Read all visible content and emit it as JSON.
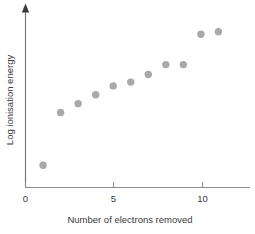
{
  "chart_data": {
    "type": "scatter",
    "title": "",
    "xlabel": "Number of electrons removed",
    "ylabel": "Log ionisation energy",
    "x": [
      1,
      2,
      3,
      4,
      5,
      6,
      7,
      8,
      9,
      10,
      11
    ],
    "values": [
      1.0,
      3.38,
      3.78,
      4.18,
      4.58,
      4.75,
      5.09,
      5.54,
      5.54,
      6.91,
      7.02
    ],
    "series": [
      {
        "name": "Log ionisation energy",
        "x": [
          1,
          2,
          3,
          4,
          5,
          6,
          7,
          8,
          9,
          10,
          11
        ],
        "values": [
          1.0,
          3.38,
          3.78,
          4.18,
          4.58,
          4.75,
          5.09,
          5.54,
          5.54,
          6.91,
          7.02
        ]
      }
    ],
    "xlim": [
      0,
      12.8
    ],
    "ylim": [
      0,
      8.0
    ],
    "xticks": [
      0,
      5,
      10
    ],
    "xtick_labels": [
      "0",
      "5",
      "10"
    ],
    "yticks": [],
    "ytick_labels": [],
    "grid": false,
    "legend": false,
    "legend_position": "none",
    "marker": "circle",
    "marker_color": "#a9a9a9",
    "marker_size": 7.4,
    "axis_color": "#8c8c8c",
    "text_color": "#3a3a3a",
    "background_color": "#ffffff",
    "y_axis_arrow": true,
    "x_axis_arrow": false,
    "annotations": []
  },
  "axes": {
    "x_title": "Number of electrons removed",
    "y_title": "Log ionisation energy",
    "x_tick_0": "0",
    "x_tick_5": "5",
    "x_tick_10": "10"
  }
}
